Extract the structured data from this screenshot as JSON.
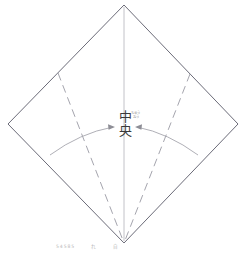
{
  "figure": {
    "title_center_main": "中",
    "title_center_sub": "央",
    "center_label_full": "中央",
    "ruby_text": "ちゅうおう",
    "caption_segments": [
      "54585",
      "れ",
      "自"
    ],
    "colors": {
      "diamond_stroke": "#6b6b78",
      "dashed_stroke": "#9a9aa4",
      "arc_stroke": "#a6a6ae",
      "axis_stroke": "#c2c2c8",
      "center_text": "#3a3a3a",
      "ruby_text": "#8a8a8a",
      "caption_text": "#b9b9b9",
      "background": "#ffffff"
    },
    "geometry": {
      "apex_top": [
        124,
        5
      ],
      "vertex_left": [
        8,
        124
      ],
      "vertex_right": [
        238,
        124
      ],
      "vertex_bottom": [
        124,
        243
      ],
      "dashed_left_start": [
        58,
        73
      ],
      "dashed_right_start": [
        190,
        74
      ],
      "arc_left_end": [
        50,
        155
      ],
      "arc_right_end": [
        198,
        155
      ],
      "arrow_left_tip": [
        114,
        127
      ],
      "arrow_right_tip": [
        136,
        127
      ],
      "center_point": [
        124,
        127
      ]
    }
  }
}
